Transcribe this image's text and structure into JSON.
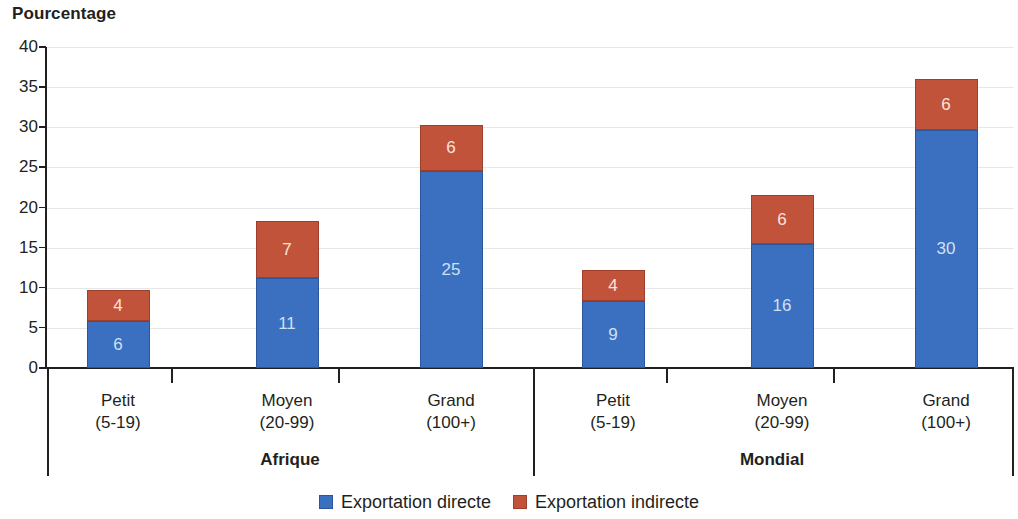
{
  "chart_data": {
    "type": "bar",
    "subtype": "stacked-bar-grouped",
    "title": "",
    "ylabel": "Pourcentage",
    "xlabel": "",
    "ylim": [
      0,
      40
    ],
    "yticks": [
      0,
      5,
      10,
      15,
      20,
      25,
      30,
      35,
      40
    ],
    "grid": true,
    "legend_position": "bottom",
    "categories": [
      "Petit\n(5-19)",
      "Moyen\n(20-99)",
      "Grand\n(100+)",
      "Petit\n(5-19)",
      "Moyen\n(20-99)",
      "Grand\n(100+)"
    ],
    "groups": [
      {
        "name": "Afrique",
        "categories": [
          "Petit (5-19)",
          "Moyen (20-99)",
          "Grand (100+)"
        ]
      },
      {
        "name": "Mondial",
        "categories": [
          "Petit (5-19)",
          "Moyen (20-99)",
          "Grand (100+)"
        ]
      }
    ],
    "series": [
      {
        "name": "Exportation directe",
        "color": "#3b6fc0",
        "values": [
          5.8,
          11.2,
          24.6,
          8.4,
          15.5,
          29.7
        ],
        "labels": [
          "6",
          "11",
          "25",
          "9",
          "16",
          "30"
        ]
      },
      {
        "name": "Exportation indirecte",
        "color": "#c2533b",
        "values": [
          3.9,
          7.1,
          5.7,
          3.8,
          6.0,
          6.3
        ],
        "labels": [
          "4",
          "7",
          "6",
          "4",
          "6",
          "6"
        ]
      }
    ],
    "totals": [
      9.7,
      18.3,
      30.3,
      12.2,
      21.5,
      36.0
    ]
  },
  "axis": {
    "y_title": "Pourcentage",
    "y_tick_labels": [
      "40",
      "35",
      "30",
      "25",
      "20",
      "15",
      "10",
      "5",
      "0"
    ]
  },
  "bars": [
    {
      "id": "afrique-petit",
      "direct_label": "6",
      "indirect_label": "4",
      "direct_value": 5.8,
      "indirect_value": 3.9
    },
    {
      "id": "afrique-moyen",
      "direct_label": "11",
      "indirect_label": "7",
      "direct_value": 11.2,
      "indirect_value": 7.1
    },
    {
      "id": "afrique-grand",
      "direct_label": "25",
      "indirect_label": "6",
      "direct_value": 24.6,
      "indirect_value": 5.7
    },
    {
      "id": "mondial-petit",
      "direct_label": "9",
      "indirect_label": "4",
      "direct_value": 8.4,
      "indirect_value": 3.8
    },
    {
      "id": "mondial-moyen",
      "direct_label": "16",
      "indirect_label": "6",
      "direct_value": 15.5,
      "indirect_value": 6.0
    },
    {
      "id": "mondial-grand",
      "direct_label": "30",
      "indirect_label": "6",
      "direct_value": 29.7,
      "indirect_value": 6.3
    }
  ],
  "category_labels": [
    {
      "line1": "Petit",
      "line2": "(5-19)"
    },
    {
      "line1": "Moyen",
      "line2": "(20-99)"
    },
    {
      "line1": "Grand",
      "line2": "(100+)"
    },
    {
      "line1": "Petit",
      "line2": "(5-19)"
    },
    {
      "line1": "Moyen",
      "line2": "(20-99)"
    },
    {
      "line1": "Grand",
      "line2": "(100+)"
    }
  ],
  "group_labels": [
    {
      "name": "Afrique"
    },
    {
      "name": "Mondial"
    }
  ],
  "legend": {
    "items": [
      {
        "label": "Exportation directe",
        "color": "#3b6fc0",
        "swatch": "legend-swatch-direct"
      },
      {
        "label": "Exportation indirecte",
        "color": "#c2533b",
        "swatch": "legend-swatch-indirect"
      }
    ]
  },
  "colors": {
    "direct": "#3b6fc0",
    "indirect": "#c2533b",
    "axis": "#231f20",
    "grid": "#e6e7e8",
    "background": "#ffffff"
  }
}
